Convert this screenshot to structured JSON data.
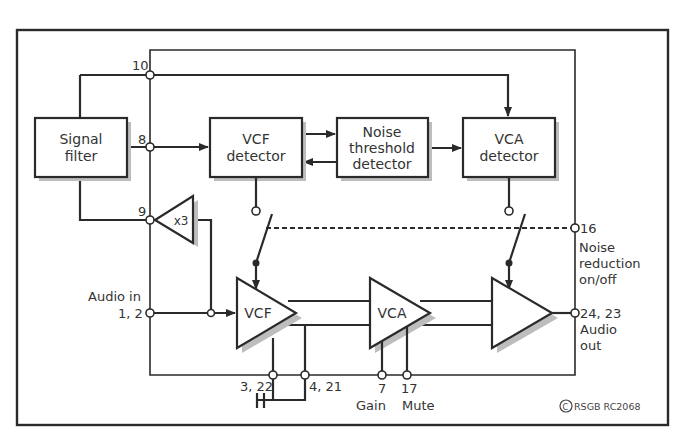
{
  "blocks": {
    "signal_filter": [
      "Signal",
      "filter"
    ],
    "vcf_detector": [
      "VCF",
      "detector"
    ],
    "noise_threshold_detector": [
      "Noise",
      "threshold",
      "detector"
    ],
    "vca_detector": [
      "VCA",
      "detector"
    ]
  },
  "amplifiers": {
    "buffer": "x3",
    "vcf": "VCF",
    "vca": "VCA",
    "output": ""
  },
  "pins": {
    "p10": "10",
    "p8": "8",
    "p9": "9",
    "audio_in_label": "Audio in",
    "audio_in_pins": "1, 2",
    "p16": "16",
    "noise_reduction": [
      "Noise",
      "reduction",
      "on/off"
    ],
    "audio_out_pins": "24, 23",
    "audio_out": [
      "Audio",
      "out"
    ],
    "p3_22": "3, 22",
    "p4_21": "4, 21",
    "p7": "7",
    "p17": "17",
    "gain": "Gain",
    "mute": "Mute"
  },
  "copyright": {
    "symbol": "C",
    "text": "RSGB RC2068"
  },
  "colors": {
    "line": "#2a2a2a",
    "text": "#333333",
    "shadow": "#bdbdbd",
    "background": "#ffffff"
  }
}
